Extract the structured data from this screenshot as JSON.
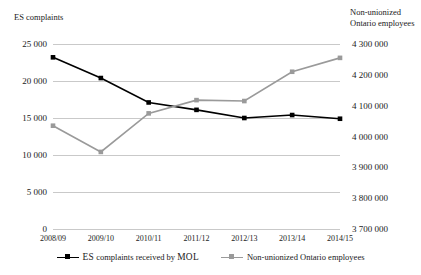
{
  "chart_data": {
    "type": "line",
    "title": "",
    "xlabel": "",
    "categories": [
      "2008/09",
      "2009/10",
      "2010/11",
      "2011/12",
      "2012/13",
      "2013/14",
      "2014/15"
    ],
    "grid": true,
    "legend_position": "bottom",
    "axes": {
      "left": {
        "label": "ES complaints",
        "ylim": [
          0,
          25000
        ],
        "ticks": [
          0,
          5000,
          10000,
          15000,
          20000,
          25000
        ],
        "tick_labels": [
          "0",
          "5 000",
          "10 000",
          "15 000",
          "20 000",
          "25 000"
        ]
      },
      "right": {
        "label": "Non-unionized\nOntario employees",
        "ylim": [
          3700000,
          4300000
        ],
        "ticks": [
          3700000,
          3800000,
          3900000,
          4000000,
          4100000,
          4200000,
          4300000
        ],
        "tick_labels": [
          "3 700 000",
          "3 800 000",
          "3 900 000",
          "4 000 000",
          "4 100 000",
          "4 200 000",
          "4 300 000"
        ]
      }
    },
    "series": [
      {
        "name": "ES complaints received by MOL",
        "legend_prefix": "ES",
        "legend_middle": " complaints received by ",
        "legend_suffix": "MOL",
        "axis": "left",
        "color": "#000000",
        "values": [
          23200,
          20400,
          17100,
          16100,
          15000,
          15400,
          14900
        ]
      },
      {
        "name": "Non-unionized Ontario employees",
        "legend_prefix": "",
        "legend_middle": "Non-unionized Ontario employees",
        "legend_suffix": "",
        "axis": "right",
        "color": "#9a9a9a",
        "values": [
          4035000,
          3950000,
          4075000,
          4118000,
          4115000,
          4210000,
          4255000
        ]
      }
    ]
  }
}
